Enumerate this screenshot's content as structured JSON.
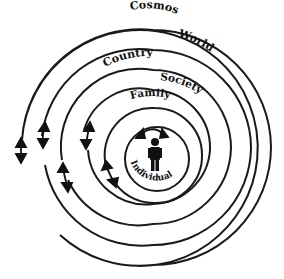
{
  "diagram": {
    "type": "concentric-spheres",
    "rings": [
      {
        "id": "individual",
        "label": "Individual"
      },
      {
        "id": "family",
        "label": "Family"
      },
      {
        "id": "society",
        "label": "Society"
      },
      {
        "id": "country",
        "label": "Country"
      },
      {
        "id": "world",
        "label": "World"
      },
      {
        "id": "cosmos",
        "label": "Cosmos"
      }
    ],
    "center_icon": "person-icon",
    "colors": {
      "stroke": "#1a1a1a",
      "background": "#ffffff"
    }
  }
}
